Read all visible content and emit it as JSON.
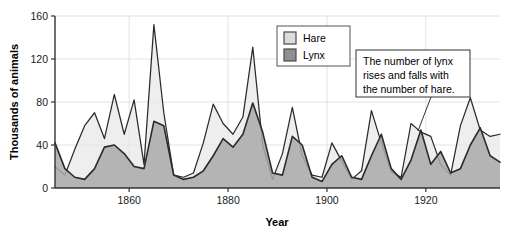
{
  "chart_data": {
    "type": "area",
    "title": "",
    "xlabel": "Year",
    "ylabel": "Thousands of animals",
    "xlim": [
      1845,
      1935
    ],
    "ylim": [
      0,
      160
    ],
    "xticks": [
      1860,
      1880,
      1900,
      1920
    ],
    "yticks": [
      0,
      40,
      80,
      120,
      160
    ],
    "grid": true,
    "legend_position": "top-center",
    "colors": {
      "hare_fill": "#e8e8e8",
      "hare_line": "#2b2b2b",
      "lynx_fill": "#a9a9a9",
      "lynx_line": "#2b2b2b",
      "axis": "#333333",
      "grid": "#e2e2e2",
      "background": "#ffffff"
    },
    "x": [
      1845,
      1847,
      1849,
      1851,
      1853,
      1855,
      1857,
      1859,
      1861,
      1863,
      1865,
      1867,
      1869,
      1871,
      1873,
      1875,
      1877,
      1879,
      1881,
      1883,
      1885,
      1887,
      1889,
      1891,
      1893,
      1895,
      1897,
      1899,
      1901,
      1903,
      1905,
      1907,
      1909,
      1911,
      1913,
      1915,
      1917,
      1919,
      1921,
      1923,
      1925,
      1927,
      1929,
      1931,
      1933,
      1935
    ],
    "series": [
      {
        "name": "Hare",
        "values": [
          20,
          12,
          36,
          58,
          70,
          46,
          87,
          50,
          82,
          22,
          152,
          70,
          12,
          10,
          14,
          42,
          78,
          60,
          50,
          66,
          131,
          40,
          8,
          32,
          75,
          30,
          12,
          10,
          42,
          25,
          8,
          16,
          72,
          42,
          15,
          10,
          60,
          52,
          48,
          22,
          12,
          58,
          84,
          54,
          48,
          50
        ]
      },
      {
        "name": "Lynx",
        "values": [
          42,
          18,
          10,
          8,
          18,
          38,
          40,
          32,
          20,
          18,
          62,
          58,
          12,
          8,
          10,
          16,
          30,
          46,
          38,
          50,
          79,
          52,
          14,
          12,
          48,
          40,
          10,
          6,
          22,
          30,
          10,
          8,
          30,
          50,
          18,
          8,
          26,
          54,
          22,
          34,
          14,
          18,
          40,
          56,
          30,
          24
        ]
      }
    ],
    "annotations": [
      {
        "name": "lynx-hare-note",
        "lines": [
          "The number of lynx",
          "rises and falls with",
          "the number of hare."
        ],
        "target_x": 1928,
        "target_y": 58
      }
    ]
  },
  "legend": {
    "entries": [
      {
        "label": "Hare",
        "swatch": "#dcdcdc"
      },
      {
        "label": "Lynx",
        "swatch": "#8f8f8f"
      }
    ]
  },
  "axes": {
    "y": {
      "title": "Thousands of animals",
      "ticks": [
        "0",
        "40",
        "80",
        "120",
        "160"
      ]
    },
    "x": {
      "title": "Year",
      "ticks": [
        "1860",
        "1880",
        "1900",
        "1920"
      ]
    }
  }
}
